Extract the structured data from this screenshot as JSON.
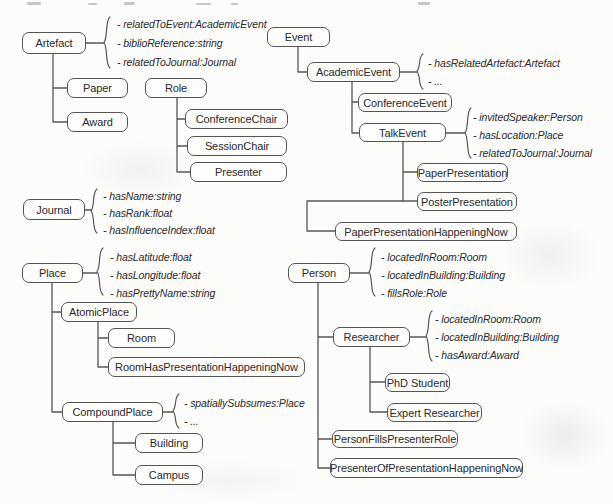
{
  "diagram_title": "Class hierarchy diagram (ontology of academic events, places, roles and persons)",
  "colors": {
    "background": "#fcfcfb",
    "box_border": "#555555",
    "box_fill": "#fdfdfc",
    "line": "#565656",
    "text": "#2b2b2b"
  },
  "nodes": {
    "artefact": "Artefact",
    "paper": "Paper",
    "award": "Award",
    "role": "Role",
    "conference_chair": "ConferenceChair",
    "session_chair": "SessionChair",
    "presenter": "Presenter",
    "journal": "Journal",
    "place": "Place",
    "atomic_place": "AtomicPlace",
    "room": "Room",
    "room_has_presentation_happening_now": "RoomHasPresentationHappeningNow",
    "compound_place": "CompoundPlace",
    "building": "Building",
    "campus": "Campus",
    "event": "Event",
    "academic_event": "AcademicEvent",
    "conference_event": "ConferenceEvent",
    "talk_event": "TalkEvent",
    "paper_presentation": "PaperPresentation",
    "poster_presentation": "PosterPresentation",
    "paper_presentation_happening_now": "PaperPresentationHappeningNow",
    "person": "Person",
    "researcher": "Researcher",
    "phd_student": "PhD Student",
    "expert_researcher": "Expert Researcher",
    "person_fills_presenter_role": "PersonFillsPresenterRole",
    "presenter_of_presentation_happening_now": "PresenterOfPresentationHappeningNow"
  },
  "attrs": {
    "artefact": [
      "- relatedToEvent:AcademicEvent",
      "- biblioReference:string",
      "- relatedToJournal:Journal"
    ],
    "journal": [
      "- hasName:string",
      "- hasRank:float",
      "- hasInfluenceIndex:float"
    ],
    "place": [
      "- hasLatitude:float",
      "- hasLongitude:float",
      "- hasPrettyName:string"
    ],
    "compound_place": [
      "- spatiallySubsumes:Place",
      "- ..."
    ],
    "academic_event": [
      "- hasRelatedArtefact:Artefact",
      "- ..."
    ],
    "talk_event": [
      "- invitedSpeaker:Person",
      "- hasLocation:Place",
      "- relatedToJournal:Journal"
    ],
    "person": [
      "- locatedInRoom:Room",
      "- locatedInBuilding:Building",
      "- fillsRole:Role"
    ],
    "researcher": [
      "- locatedInRoom:Room",
      "- locatedInBuilding:Building",
      "- hasAward:Award"
    ]
  },
  "edges": [
    {
      "parent": "Artefact",
      "child": "Paper"
    },
    {
      "parent": "Artefact",
      "child": "Award"
    },
    {
      "parent": "Role",
      "child": "ConferenceChair"
    },
    {
      "parent": "Role",
      "child": "SessionChair"
    },
    {
      "parent": "Role",
      "child": "Presenter"
    },
    {
      "parent": "Place",
      "child": "AtomicPlace"
    },
    {
      "parent": "Place",
      "child": "CompoundPlace"
    },
    {
      "parent": "AtomicPlace",
      "child": "Room"
    },
    {
      "parent": "AtomicPlace",
      "child": "RoomHasPresentationHappeningNow"
    },
    {
      "parent": "CompoundPlace",
      "child": "Building"
    },
    {
      "parent": "CompoundPlace",
      "child": "Campus"
    },
    {
      "parent": "Event",
      "child": "AcademicEvent"
    },
    {
      "parent": "AcademicEvent",
      "child": "ConferenceEvent"
    },
    {
      "parent": "AcademicEvent",
      "child": "TalkEvent"
    },
    {
      "parent": "TalkEvent",
      "child": "PaperPresentation"
    },
    {
      "parent": "TalkEvent",
      "child": "PosterPresentation"
    },
    {
      "parent": "TalkEvent",
      "child": "PaperPresentationHappeningNow"
    },
    {
      "parent": "Person",
      "child": "Researcher"
    },
    {
      "parent": "Person",
      "child": "PersonFillsPresenterRole"
    },
    {
      "parent": "Person",
      "child": "PresenterOfPresentationHappeningNow"
    },
    {
      "parent": "Researcher",
      "child": "PhD Student"
    },
    {
      "parent": "Researcher",
      "child": "Expert Researcher"
    }
  ]
}
